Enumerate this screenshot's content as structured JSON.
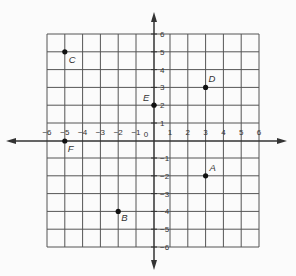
{
  "chart_data": {
    "type": "scatter",
    "title": "",
    "xlabel": "",
    "ylabel": "",
    "xlim": [
      -6,
      6
    ],
    "ylim": [
      -6,
      6
    ],
    "grid": true,
    "x_ticks": [
      -6,
      -5,
      -4,
      -3,
      -2,
      -1,
      0,
      1,
      2,
      3,
      4,
      5,
      6
    ],
    "y_ticks": [
      -6,
      -5,
      -4,
      -3,
      -2,
      -1,
      1,
      2,
      3,
      4,
      5,
      6
    ],
    "points": [
      {
        "label": "A",
        "x": 3,
        "y": -2
      },
      {
        "label": "B",
        "x": -2,
        "y": -4
      },
      {
        "label": "C",
        "x": -5,
        "y": 5
      },
      {
        "label": "D",
        "x": 3,
        "y": 3
      },
      {
        "label": "E",
        "x": 0,
        "y": 2
      },
      {
        "label": "F",
        "x": -5,
        "y": 0
      }
    ]
  },
  "colors": {
    "grid": "#555555",
    "axis": "#333333",
    "point": "#111111",
    "background": "#fbfbfb"
  }
}
